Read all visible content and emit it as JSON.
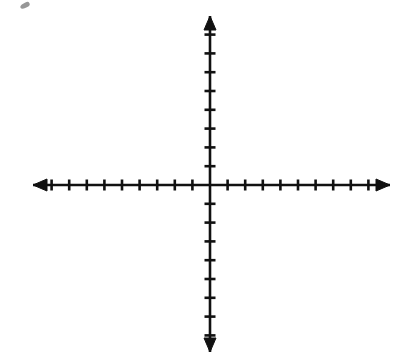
{
  "figure": {
    "kind": "blank-cartesian-axes",
    "width": 402,
    "height": 364,
    "background_color": "#ffffff",
    "ink_color": "#111111"
  },
  "chart_data": {
    "type": "scatter",
    "title": "",
    "subtitle": "",
    "xlabel": "",
    "ylabel": "",
    "series": [
      {
        "name": "",
        "x": [],
        "y": []
      }
    ],
    "x": [],
    "values": [],
    "categories": [],
    "xlim": [
      -9,
      9
    ],
    "ylim": [
      -8,
      8
    ],
    "x_tick_values": [
      -9,
      -8,
      -7,
      -6,
      -5,
      -4,
      -3,
      -2,
      -1,
      1,
      2,
      3,
      4,
      5,
      6,
      7,
      8,
      9
    ],
    "y_tick_values": [
      -8,
      -7,
      -6,
      -5,
      -4,
      -3,
      -2,
      -1,
      1,
      2,
      3,
      4,
      5,
      6,
      7,
      8
    ],
    "x_tick_labels": [],
    "y_tick_labels": [],
    "grid": false,
    "legend": [],
    "legend_position": "none",
    "annotations": [],
    "axis_style": {
      "arrows": [
        "left",
        "right",
        "up",
        "down"
      ],
      "tick_count_left": 9,
      "tick_count_right": 9,
      "tick_count_up": 8,
      "tick_count_down": 8,
      "tick_length_px": 11,
      "line_width_px": 2.6
    }
  },
  "geometry": {
    "origin_x": 210,
    "origin_y": 185,
    "x_axis_start": 33,
    "x_axis_end": 390,
    "y_axis_top": 16,
    "y_axis_bottom": 352,
    "x_tick_spacing": 17.6,
    "y_tick_spacing": 18.8,
    "tick_half_length": 5.5,
    "arrow_length": 14,
    "arrow_half_width": 6
  },
  "artifacts": [
    {
      "name": "scan-speck",
      "left": 20,
      "top": 3,
      "width": 10,
      "height": 5,
      "rotation": -28,
      "color": "#6f6f6f",
      "opacity": 0.72
    }
  ]
}
